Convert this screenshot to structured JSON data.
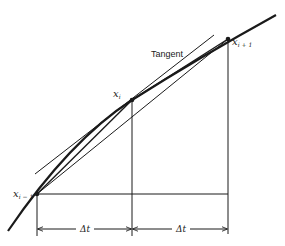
{
  "diagram": {
    "labels": {
      "tangent": "Tangent",
      "x_prev_base": "x",
      "x_prev_sub": "i − 1",
      "x_curr_base": "x",
      "x_curr_sub": "i",
      "x_next_base": "x",
      "x_next_sub": "i + 1",
      "delta_left": "Δt",
      "delta_right": "Δt"
    },
    "points": {
      "x_prev": [
        37,
        194
      ],
      "x_curr": [
        132,
        100
      ],
      "x_next": [
        228,
        39
      ]
    },
    "colors": {
      "ink": "#1a1a1a",
      "background": "#ffffff"
    }
  }
}
